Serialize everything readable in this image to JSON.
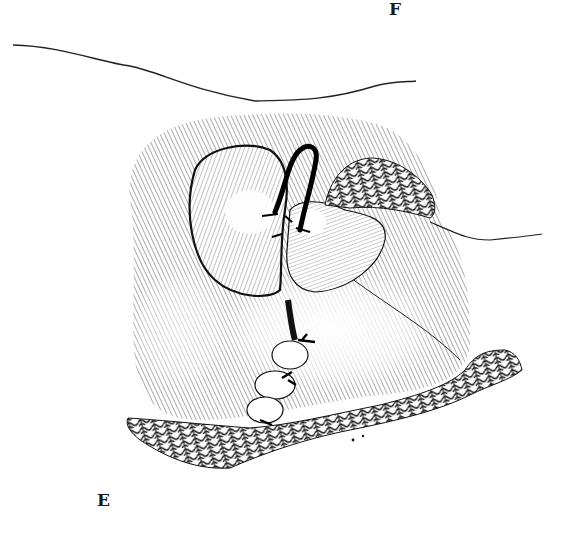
{
  "figure": {
    "type": "surgical line illustration",
    "labels": {
      "top": "F",
      "bottom": "E"
    },
    "colors": {
      "ink": "#1a1a1a",
      "background": "#ffffff"
    }
  }
}
